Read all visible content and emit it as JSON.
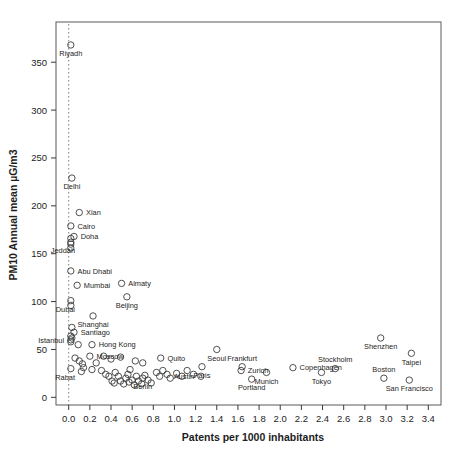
{
  "chart_data": {
    "type": "scatter",
    "title": "",
    "xlabel": "Patents per 1000 inhabitants",
    "ylabel": "PM10 Annual mean µG/m3",
    "xlim": [
      -0.12,
      3.52
    ],
    "ylim": [
      -8,
      392
    ],
    "xticks": [
      "0.0",
      "0.2",
      "0.4",
      "0.6",
      "0.8",
      "1.0",
      "1.2",
      "1.4",
      "1.6",
      "1.8",
      "2.0",
      "2.2",
      "2.4",
      "2.6",
      "2.8",
      "3.0",
      "3.2",
      "3.4"
    ],
    "xtick_values": [
      0.0,
      0.2,
      0.4,
      0.6,
      0.8,
      1.0,
      1.2,
      1.4,
      1.6,
      1.8,
      2.0,
      2.2,
      2.4,
      2.6,
      2.8,
      3.0,
      3.2,
      3.4
    ],
    "yticks": [
      "0",
      "50",
      "100",
      "150",
      "200",
      "250",
      "300",
      "350"
    ],
    "ytick_values": [
      0,
      50,
      100,
      150,
      200,
      250,
      300,
      350
    ],
    "grid": false,
    "legend": null,
    "reference_line": {
      "type": "vertical-dotted",
      "x": 0.0,
      "style": "dotted",
      "color": "#808080"
    },
    "marker": {
      "shape": "open-circle",
      "color": "#3d3d3d",
      "radius_px": 3.2
    },
    "labeled_points": [
      {
        "city": "Riyadh",
        "x": 0.02,
        "y": 368,
        "label_pos": "below"
      },
      {
        "city": "Delhi",
        "x": 0.03,
        "y": 229,
        "label_pos": "below"
      },
      {
        "city": "Xian",
        "x": 0.1,
        "y": 193,
        "label_pos": "right"
      },
      {
        "city": "Cairo",
        "x": 0.02,
        "y": 179,
        "label_pos": "right"
      },
      {
        "city": "Doha",
        "x": 0.05,
        "y": 168,
        "label_pos": "right"
      },
      {
        "city": "Jeddah",
        "x": 0.02,
        "y": 162,
        "label_pos": "below-left"
      },
      {
        "city": "Abu Dhabi",
        "x": 0.02,
        "y": 132,
        "label_pos": "right"
      },
      {
        "city": "Mumbai",
        "x": 0.08,
        "y": 117,
        "label_pos": "right"
      },
      {
        "city": "Almaty",
        "x": 0.5,
        "y": 119,
        "label_pos": "right"
      },
      {
        "city": "Beijing",
        "x": 0.55,
        "y": 105,
        "label_pos": "below"
      },
      {
        "city": "Dubai",
        "x": 0.02,
        "y": 101,
        "label_pos": "below-left"
      },
      {
        "city": "Shanghai",
        "x": 0.23,
        "y": 85,
        "label_pos": "below"
      },
      {
        "city": "Santiago",
        "x": 0.05,
        "y": 68,
        "label_pos": "right"
      },
      {
        "city": "Istanbul",
        "x": 0.02,
        "y": 60,
        "label_pos": "left"
      },
      {
        "city": "Hong Kong",
        "x": 0.22,
        "y": 55,
        "label_pos": "right"
      },
      {
        "city": "Moscow",
        "x": 0.2,
        "y": 43,
        "label_pos": "right"
      },
      {
        "city": "Rabat",
        "x": 0.02,
        "y": 30,
        "label_pos": "below-left"
      },
      {
        "city": "Quito",
        "x": 0.87,
        "y": 41,
        "label_pos": "right"
      },
      {
        "city": "Seoul",
        "x": 1.4,
        "y": 50,
        "label_pos": "below"
      },
      {
        "city": "Paris",
        "x": 1.26,
        "y": 32,
        "label_pos": "below"
      },
      {
        "city": "Austin",
        "x": 1.25,
        "y": 22,
        "label_pos": "left"
      },
      {
        "city": "Berlin",
        "x": 0.7,
        "y": 20,
        "label_pos": "below"
      },
      {
        "city": "Frankfurt",
        "x": 1.64,
        "y": 32,
        "label_pos": "above"
      },
      {
        "city": "Zurich",
        "x": 1.63,
        "y": 28,
        "label_pos": "right"
      },
      {
        "city": "Munich",
        "x": 1.87,
        "y": 26,
        "label_pos": "below"
      },
      {
        "city": "Portland",
        "x": 1.73,
        "y": 19,
        "label_pos": "below"
      },
      {
        "city": "Copenhagen",
        "x": 2.12,
        "y": 31,
        "label_pos": "right"
      },
      {
        "city": "Tokyo",
        "x": 2.39,
        "y": 26,
        "label_pos": "below"
      },
      {
        "city": "Stockholm",
        "x": 2.52,
        "y": 30,
        "label_pos": "above"
      },
      {
        "city": "Shenzhen",
        "x": 2.95,
        "y": 62,
        "label_pos": "below"
      },
      {
        "city": "Taipei",
        "x": 3.24,
        "y": 46,
        "label_pos": "below"
      },
      {
        "city": "Boston",
        "x": 2.98,
        "y": 20,
        "label_pos": "above"
      },
      {
        "city": "San Francisco",
        "x": 3.22,
        "y": 18,
        "label_pos": "below"
      }
    ],
    "unlabeled_points": [
      {
        "x": 0.02,
        "y": 166
      },
      {
        "x": 0.02,
        "y": 160
      },
      {
        "x": 0.02,
        "y": 156
      },
      {
        "x": 0.02,
        "y": 96
      },
      {
        "x": 0.03,
        "y": 73
      },
      {
        "x": 0.02,
        "y": 64
      },
      {
        "x": 0.03,
        "y": 62
      },
      {
        "x": 0.02,
        "y": 58
      },
      {
        "x": 0.09,
        "y": 55
      },
      {
        "x": 0.06,
        "y": 41
      },
      {
        "x": 0.1,
        "y": 38
      },
      {
        "x": 0.13,
        "y": 35
      },
      {
        "x": 0.14,
        "y": 31
      },
      {
        "x": 0.12,
        "y": 27
      },
      {
        "x": 0.22,
        "y": 29
      },
      {
        "x": 0.26,
        "y": 36
      },
      {
        "x": 0.31,
        "y": 28
      },
      {
        "x": 0.35,
        "y": 24
      },
      {
        "x": 0.38,
        "y": 22
      },
      {
        "x": 0.41,
        "y": 17
      },
      {
        "x": 0.43,
        "y": 15
      },
      {
        "x": 0.44,
        "y": 26
      },
      {
        "x": 0.47,
        "y": 22
      },
      {
        "x": 0.49,
        "y": 17
      },
      {
        "x": 0.52,
        "y": 14
      },
      {
        "x": 0.54,
        "y": 20
      },
      {
        "x": 0.56,
        "y": 24
      },
      {
        "x": 0.57,
        "y": 16
      },
      {
        "x": 0.58,
        "y": 29
      },
      {
        "x": 0.6,
        "y": 18
      },
      {
        "x": 0.62,
        "y": 13
      },
      {
        "x": 0.64,
        "y": 22
      },
      {
        "x": 0.66,
        "y": 17
      },
      {
        "x": 0.63,
        "y": 38
      },
      {
        "x": 0.7,
        "y": 36
      },
      {
        "x": 0.69,
        "y": 14
      },
      {
        "x": 0.72,
        "y": 23
      },
      {
        "x": 0.75,
        "y": 18
      },
      {
        "x": 0.78,
        "y": 15
      },
      {
        "x": 0.49,
        "y": 42
      },
      {
        "x": 0.4,
        "y": 40
      },
      {
        "x": 0.33,
        "y": 43
      },
      {
        "x": 0.83,
        "y": 26
      },
      {
        "x": 0.86,
        "y": 22
      },
      {
        "x": 0.89,
        "y": 28
      },
      {
        "x": 0.93,
        "y": 24
      },
      {
        "x": 0.96,
        "y": 20
      },
      {
        "x": 1.02,
        "y": 25
      },
      {
        "x": 1.07,
        "y": 22
      },
      {
        "x": 1.12,
        "y": 28
      },
      {
        "x": 1.18,
        "y": 24
      }
    ]
  },
  "axes": {
    "xlabel": "Patents per 1000 inhabitants",
    "ylabel": "PM10 Annual mean µG/m3"
  }
}
